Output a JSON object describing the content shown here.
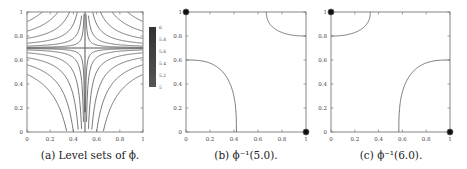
{
  "figure": {
    "panels": [
      {
        "id": "a",
        "caption": "(a) Level sets of ϕ."
      },
      {
        "id": "b",
        "caption": "(b) ϕ⁻¹(5.0)."
      },
      {
        "id": "c",
        "caption": "(c) ϕ⁻¹(6.0)."
      }
    ]
  },
  "chart_data": [
    {
      "type": "contour",
      "title": "Level sets of ϕ",
      "xlim": [
        0,
        1
      ],
      "ylim": [
        0,
        1
      ],
      "xticks": [
        "0",
        "0.2",
        "0.4",
        "0.6",
        "0.8",
        "1"
      ],
      "yticks": [
        "0",
        "0.2",
        "0.4",
        "0.6",
        "0.8",
        "1"
      ],
      "saddle_point": [
        0.5,
        0.7
      ],
      "colorbar": {
        "ticks": [
          "6",
          "5.8",
          "5.6",
          "5.4",
          "5.2",
          "5"
        ],
        "range": [
          5,
          6
        ]
      },
      "grid": false
    },
    {
      "type": "line",
      "title": "ϕ⁻¹(5.0)",
      "xlim": [
        0,
        1
      ],
      "ylim": [
        0,
        1
      ],
      "xticks": [
        "0",
        "0.2",
        "0.4",
        "0.6",
        "0.8",
        "1"
      ],
      "yticks": [
        "0",
        "0.2",
        "0.4",
        "0.6",
        "0.8",
        "1"
      ],
      "curves": [
        {
          "from": [
            0,
            0.6
          ],
          "to": [
            0.42,
            0
          ]
        },
        {
          "from": [
            0.67,
            1
          ],
          "to": [
            1,
            0.8
          ]
        }
      ],
      "points": [
        [
          0,
          1
        ],
        [
          1,
          0
        ]
      ]
    },
    {
      "type": "line",
      "title": "ϕ⁻¹(6.0)",
      "xlim": [
        0,
        1
      ],
      "ylim": [
        0,
        1
      ],
      "xticks": [
        "0",
        "0.2",
        "0.4",
        "0.6",
        "0.8",
        "1"
      ],
      "yticks": [
        "0",
        "0.2",
        "0.4",
        "0.6",
        "0.8",
        "1"
      ],
      "curves": [
        {
          "from": [
            0,
            0.8
          ],
          "to": [
            0.33,
            1
          ]
        },
        {
          "from": [
            0.57,
            0
          ],
          "to": [
            1,
            0.6
          ]
        }
      ],
      "points": [
        [
          0,
          1
        ],
        [
          1,
          0
        ]
      ]
    }
  ]
}
